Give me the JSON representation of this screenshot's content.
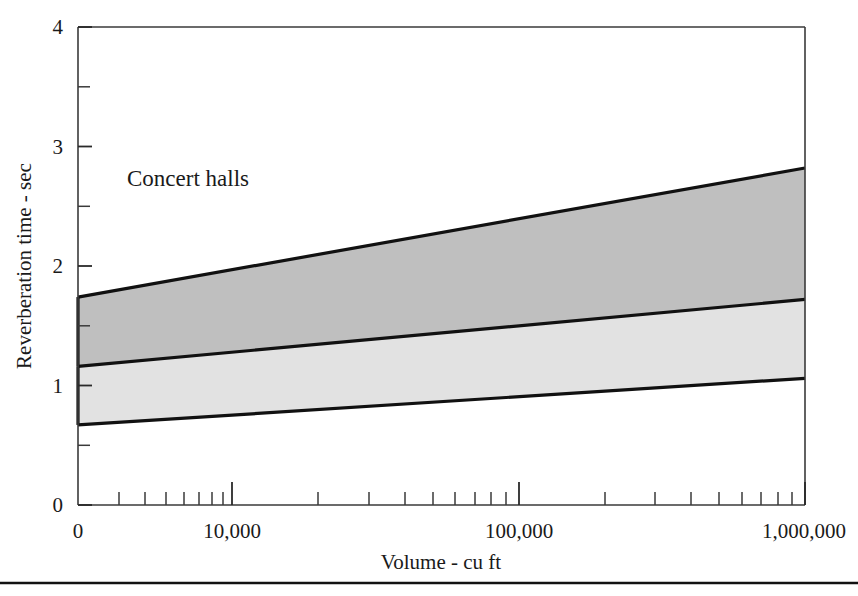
{
  "chart_data": {
    "type": "area",
    "title": "",
    "annotation": "Concert halls",
    "xlabel": "Volume - cu ft",
    "ylabel": "Reverberation time - sec",
    "xscale": "log",
    "yscale": "linear",
    "xlim": [
      10000,
      1000000
    ],
    "ylim": [
      0,
      4
    ],
    "grid": false,
    "legend": false,
    "x_tick_labels": [
      "0",
      "10,000",
      "100,000",
      "1,000,000"
    ],
    "x_tick_values": [
      0,
      10000,
      100000,
      1000000
    ],
    "x_minor_ticks": [
      20000,
      30000,
      40000,
      50000,
      60000,
      70000,
      80000,
      90000,
      200000,
      300000,
      400000,
      500000,
      600000,
      700000,
      800000,
      900000
    ],
    "y_tick_labels": [
      "0",
      "1",
      "2",
      "3",
      "4"
    ],
    "y_tick_values": [
      0,
      1,
      2,
      3,
      4
    ],
    "y_minor_ticks": [
      0.5,
      1.5,
      2.5,
      3.5
    ],
    "x": [
      10000,
      1000000
    ],
    "series": [
      {
        "name": "upper-band-top",
        "role": "upper bound of darker band",
        "values": [
          1.74,
          2.82
        ]
      },
      {
        "name": "band-divider",
        "role": "boundary between darker and lighter band",
        "values": [
          1.16,
          1.72
        ]
      },
      {
        "name": "lower-band-bottom",
        "role": "lower bound of lighter band",
        "values": [
          0.67,
          1.06
        ]
      }
    ],
    "bands": [
      {
        "name": "upper-range",
        "fill": "#bfbfbf",
        "top_values": [
          1.74,
          2.82
        ],
        "bottom_values": [
          1.16,
          1.72
        ]
      },
      {
        "name": "lower-range",
        "fill": "#e2e2e2",
        "top_values": [
          1.16,
          1.72
        ],
        "bottom_values": [
          0.67,
          1.06
        ]
      }
    ]
  },
  "figure": {
    "annotation_label": "Concert halls",
    "x_axis_title": "Volume - cu ft",
    "y_axis_title": "Reverberation time - sec",
    "x_labels": {
      "origin": "0",
      "ten_thousand": "10,000",
      "hundred_thousand": "100,000",
      "million": "1,000,000"
    },
    "y_labels": {
      "v0": "0",
      "v1": "1",
      "v2": "2",
      "v3": "3",
      "v4": "4"
    },
    "colors": {
      "upper_band": "#bfbfbf",
      "lower_band": "#e2e2e2",
      "line": "#111111",
      "axis": "#3a3a3a",
      "background": "#ffffff"
    }
  }
}
